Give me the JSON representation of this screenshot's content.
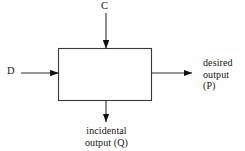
{
  "diagram": {
    "type": "block-diagram",
    "background_color": "#fefefe",
    "line_color": "#333333",
    "text_color": "#161616",
    "process_box": {
      "name": "process-box",
      "x": 58,
      "y": 48,
      "width": 94,
      "height": 53,
      "fill": "none",
      "stroke": "#3a3a3a"
    },
    "inputs": [
      {
        "id": "control-input",
        "label": "C",
        "direction": "down",
        "enters_edge": "top",
        "label_x": 106,
        "label_y": 7
      },
      {
        "id": "material-input",
        "label": "D",
        "direction": "right",
        "enters_edge": "left",
        "label_x": 12,
        "label_y": 73
      }
    ],
    "outputs": [
      {
        "id": "desired-output",
        "label_lines": [
          "desired",
          "output",
          "(P)"
        ],
        "label_text": "desired output (P)",
        "direction": "right",
        "exits_edge": "right",
        "label_x": 203,
        "label_y": 57
      },
      {
        "id": "incidental-output",
        "label_lines": [
          "incidental",
          "output (Q)"
        ],
        "label_text": "incidental output (Q)",
        "direction": "down",
        "exits_edge": "bottom",
        "label_x": 106,
        "label_y": 125
      }
    ]
  }
}
